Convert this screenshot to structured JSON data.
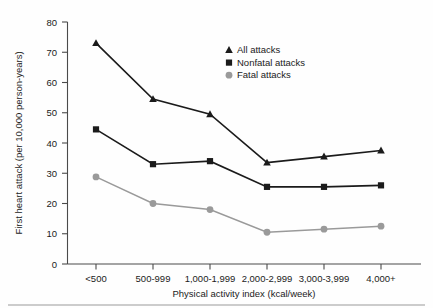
{
  "chart_data": {
    "type": "line",
    "title": "",
    "xlabel": "Physical activity index (kcal/week)",
    "ylabel": "First heart attack (per 10,000 person-years)",
    "categories": [
      "<500",
      "500-999",
      "1,000-1,999",
      "2,000-2,999",
      "3,000-3,999",
      "4,000+"
    ],
    "ylim": [
      0,
      80
    ],
    "yticks": [
      0,
      10,
      20,
      30,
      40,
      50,
      60,
      70,
      80
    ],
    "grid": false,
    "legend_position": "upper-right-inside",
    "series": [
      {
        "name": "All attacks",
        "marker": "triangle",
        "color": "#1b1b1b",
        "values": [
          73,
          54.5,
          49.5,
          33.5,
          35.5,
          37.5
        ]
      },
      {
        "name": "Nonfatal attacks",
        "marker": "square",
        "color": "#1b1b1b",
        "values": [
          44.5,
          33,
          34,
          25.5,
          25.5,
          26
        ]
      },
      {
        "name": "Fatal attacks",
        "marker": "circle",
        "color": "#9a9a9a",
        "values": [
          28.8,
          20,
          18,
          10.5,
          11.5,
          12.5
        ]
      }
    ]
  },
  "axes": {
    "ytick_labels": [
      "0",
      "10",
      "20",
      "30",
      "40",
      "50",
      "60",
      "70",
      "80"
    ],
    "xtick_labels": [
      "<500",
      "500-999",
      "1,000-1,999",
      "2,000-2,999",
      "3,000-3,999",
      "4,000+"
    ],
    "x_axis_title": "Physical activity index (kcal/week)",
    "y_axis_title": "First heart attack (per 10,000 person-years)"
  },
  "legend": {
    "items": [
      {
        "label": "All attacks",
        "marker": "triangle-marker",
        "color": "#1b1b1b"
      },
      {
        "label": "Nonfatal attacks",
        "marker": "square-marker",
        "color": "#1b1b1b"
      },
      {
        "label": "Fatal attacks",
        "marker": "circle-marker",
        "color": "#9a9a9a"
      }
    ]
  },
  "colors": {
    "all_attacks": "#1b1b1b",
    "nonfatal_attacks": "#1b1b1b",
    "fatal_attacks": "#9a9a9a",
    "axis": "#4a4a4a",
    "background": "#fefefe"
  }
}
